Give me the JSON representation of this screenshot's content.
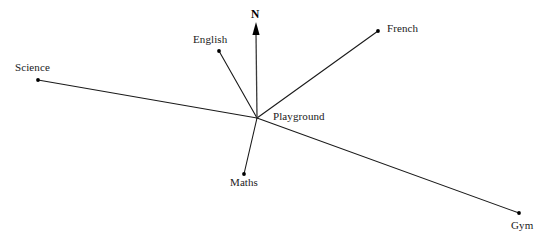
{
  "diagram": {
    "background_color": "#ffffff",
    "line_color": "#1a1a1a",
    "dot_color": "#000000",
    "text_color": "#1a1a1a",
    "width": 552,
    "height": 242,
    "north": {
      "label": "N",
      "label_x": 251,
      "label_y": 8,
      "arrow_from_x": 257,
      "arrow_from_y": 118,
      "arrow_to_x": 256,
      "arrow_to_y": 22
    },
    "center": {
      "name": "Playground",
      "label": "Playground",
      "x": 257,
      "y": 118,
      "label_x": 273,
      "label_y": 110,
      "has_dot": false
    },
    "destinations": [
      {
        "name": "Science",
        "label": "Science",
        "x": 38,
        "y": 80,
        "label_x": 15,
        "label_y": 61,
        "has_dot": true
      },
      {
        "name": "English",
        "label": "English",
        "x": 219,
        "y": 51,
        "label_x": 193,
        "label_y": 33,
        "has_dot": true
      },
      {
        "name": "French",
        "label": "French",
        "x": 378,
        "y": 31,
        "label_x": 387,
        "label_y": 22,
        "has_dot": true
      },
      {
        "name": "Maths",
        "label": "Maths",
        "x": 244,
        "y": 174,
        "label_x": 230,
        "label_y": 176,
        "has_dot": true
      },
      {
        "name": "Gym",
        "label": "Gym",
        "x": 519,
        "y": 213,
        "label_x": 511,
        "label_y": 219,
        "has_dot": true
      }
    ]
  }
}
